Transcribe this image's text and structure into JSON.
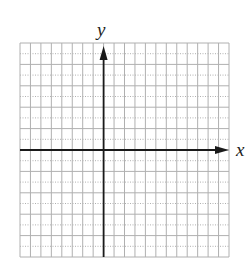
{
  "chart_data": {
    "type": "scatter",
    "title": "",
    "xlabel": "x",
    "ylabel": "y",
    "grid": true,
    "grid_columns": 20,
    "grid_rows": 20,
    "columns_left_of_y_axis": 8,
    "columns_right_of_y_axis": 12,
    "rows_above_x_axis": 10,
    "rows_below_x_axis": 10,
    "xlim": [
      -8,
      12
    ],
    "ylim": [
      -10,
      10
    ],
    "x_axis_arrow": "right",
    "y_axis_arrow": "up",
    "series": []
  },
  "axes": {
    "x_label": "x",
    "y_label": "y"
  },
  "colors": {
    "grid": "#b0b0b0",
    "axis": "#1a1a1a",
    "background": "#ffffff"
  }
}
